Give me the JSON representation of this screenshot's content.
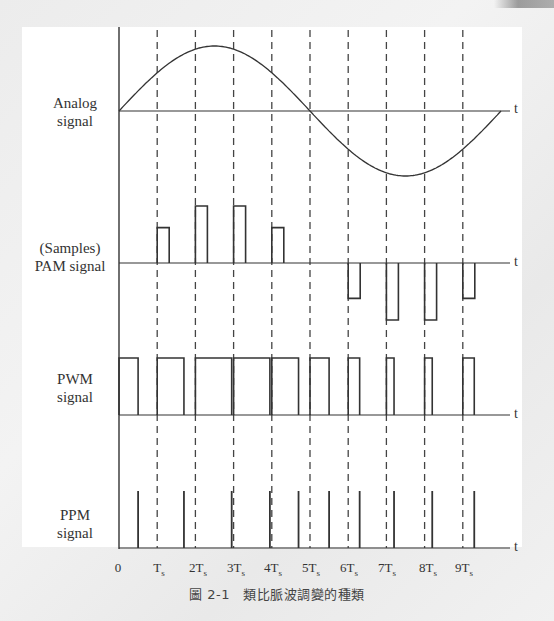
{
  "figure": {
    "caption": "圖 2-1　類比脈波調變的種類",
    "axis_label_t": "t",
    "x_ticks": [
      {
        "label": "0",
        "sub": "",
        "x": 118
      },
      {
        "label": "T",
        "sub": "s",
        "x": 159
      },
      {
        "label": "2T",
        "sub": "s",
        "x": 198
      },
      {
        "label": "3T",
        "sub": "s",
        "x": 236
      },
      {
        "label": "4T",
        "sub": "s",
        "x": 273
      },
      {
        "label": "5T",
        "sub": "s",
        "x": 311
      },
      {
        "label": "6T",
        "sub": "s",
        "x": 349
      },
      {
        "label": "7T",
        "sub": "s",
        "x": 387
      },
      {
        "label": "8T",
        "sub": "s",
        "x": 428
      },
      {
        "label": "9T",
        "sub": "s",
        "x": 464
      }
    ],
    "panels": {
      "analog": {
        "label_line1": "Analog",
        "label_line2": "signal"
      },
      "pam": {
        "label_line1": "(Samples)",
        "label_line2": "PAM signal"
      },
      "pwm": {
        "label_line1": "PWM",
        "label_line2": "signal"
      },
      "ppm": {
        "label_line1": "PPM",
        "label_line2": "signal"
      }
    },
    "colors": {
      "stroke": "#333333",
      "dash": "#444444",
      "background": "#ffffff"
    }
  },
  "chart_data": {
    "type": "line",
    "xlabel": "t",
    "x_ticks": [
      "0",
      "Ts",
      "2Ts",
      "3Ts",
      "4Ts",
      "5Ts",
      "6Ts",
      "7Ts",
      "8Ts",
      "9Ts"
    ],
    "sample_times": [
      1,
      2,
      3,
      4,
      5,
      6,
      7,
      8,
      9
    ],
    "series": [
      {
        "name": "Analog signal",
        "kind": "sine",
        "period_Ts": 10,
        "amplitude": 1.0
      },
      {
        "name": "PAM signal",
        "values": [
          0.59,
          0.95,
          0.95,
          0.59,
          0.0,
          -0.59,
          -0.95,
          -0.95,
          -0.59
        ]
      },
      {
        "name": "PWM signal",
        "pulse_widths_rel": [
          0.5,
          0.7,
          0.95,
          0.95,
          0.7,
          0.5,
          0.3,
          0.2,
          0.2,
          0.3
        ]
      },
      {
        "name": "PPM signal",
        "pulse_positions_rel": [
          0.5,
          0.7,
          0.95,
          0.95,
          0.7,
          0.5,
          0.3,
          0.2,
          0.2,
          0.3
        ]
      }
    ],
    "grid": "dashed vertical at each Ts"
  }
}
